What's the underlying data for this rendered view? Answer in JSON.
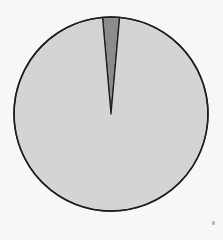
{
  "chart_data": {
    "type": "pie",
    "title": "",
    "labels": [
      "Small segment",
      "Remainder"
    ],
    "values": [
      2.8,
      97.2
    ],
    "colors": [
      "#8c8c8c",
      "#d4d4d4"
    ],
    "start_angle_deg": -5,
    "legend": null,
    "center": [
      111,
      114
    ],
    "radius": 97,
    "outline_color": "#1e1e1e"
  }
}
